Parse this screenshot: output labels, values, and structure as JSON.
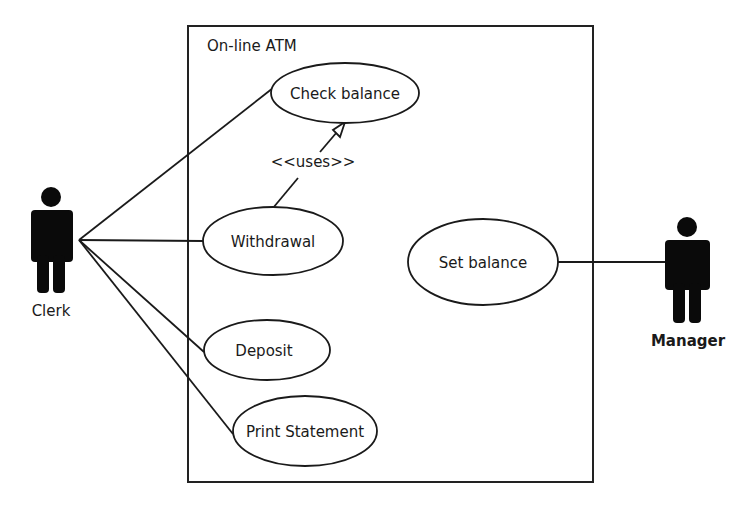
{
  "diagram": {
    "type": "uml-use-case",
    "system": {
      "title": "On-line ATM"
    },
    "actors": [
      {
        "id": "clerk",
        "label": "Clerk"
      },
      {
        "id": "manager",
        "label": "Manager"
      }
    ],
    "use_cases": [
      {
        "id": "check-balance",
        "label": "Check balance"
      },
      {
        "id": "withdrawal",
        "label": "Withdrawal"
      },
      {
        "id": "deposit",
        "label": "Deposit"
      },
      {
        "id": "print-statement",
        "label": "Print Statement"
      },
      {
        "id": "set-balance",
        "label": "Set balance"
      }
    ],
    "relations": [
      {
        "from": "clerk",
        "to": "check-balance",
        "type": "association"
      },
      {
        "from": "clerk",
        "to": "withdrawal",
        "type": "association"
      },
      {
        "from": "clerk",
        "to": "deposit",
        "type": "association"
      },
      {
        "from": "clerk",
        "to": "print-statement",
        "type": "association"
      },
      {
        "from": "manager",
        "to": "set-balance",
        "type": "association"
      },
      {
        "from": "withdrawal",
        "to": "check-balance",
        "type": "generalization",
        "label": "<<uses>>"
      }
    ]
  }
}
